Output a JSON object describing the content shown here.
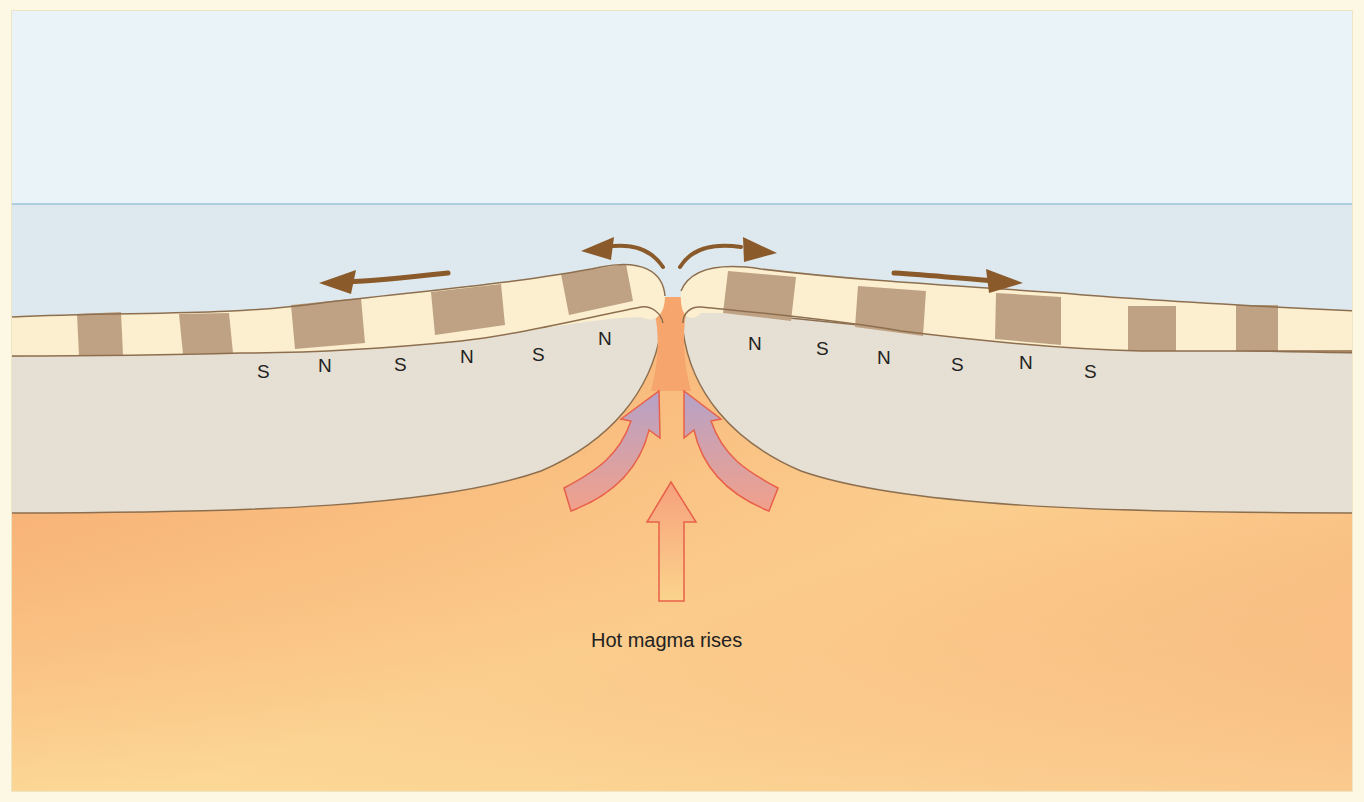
{
  "diagram": {
    "caption": "Hot magma rises",
    "left_plate_labels": [
      "S",
      "N",
      "S",
      "N",
      "S",
      "N"
    ],
    "right_plate_labels": [
      "N",
      "S",
      "N",
      "S",
      "N",
      "S"
    ],
    "layers": [
      {
        "name": "sky",
        "color": "#eaf3f8"
      },
      {
        "name": "ocean",
        "color": "#dde9ee"
      },
      {
        "name": "magnetic-stripe-normal",
        "color": "#bfa283"
      },
      {
        "name": "magnetic-stripe-reversed",
        "color": "#fbefcf"
      },
      {
        "name": "lithosphere",
        "color": "#e6dfd3"
      },
      {
        "name": "mantle-magma",
        "color": "#f8b27a"
      }
    ],
    "arrows": [
      {
        "name": "plate-movement-left",
        "direction": "left",
        "color": "#8b5a2b"
      },
      {
        "name": "plate-movement-right",
        "direction": "right",
        "color": "#8b5a2b"
      },
      {
        "name": "ridge-divergence-left",
        "direction": "up-left",
        "color": "#8b5a2b"
      },
      {
        "name": "ridge-divergence-right",
        "direction": "up-right",
        "color": "#8b5a2b"
      },
      {
        "name": "magma-upwelling-center",
        "direction": "up"
      },
      {
        "name": "magma-upwelling-left",
        "direction": "up-curving-left"
      },
      {
        "name": "magma-upwelling-right",
        "direction": "up-curving-right"
      }
    ]
  }
}
